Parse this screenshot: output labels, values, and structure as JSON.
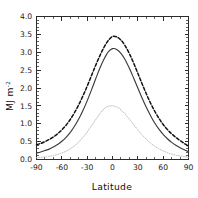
{
  "chart_data": {
    "type": "line",
    "title": "",
    "subtitle": "",
    "xlabel": "Latitude",
    "ylabel": "MJ m",
    "ylabel_exponent": "-2",
    "ylabel_full": "MJ m-2",
    "xlim": [
      -90,
      90
    ],
    "ylim": [
      0.0,
      4.0
    ],
    "xticks": [
      -90,
      -60,
      -30,
      0,
      30,
      60,
      90
    ],
    "xtick_labels": [
      "-90",
      "-60",
      "-30",
      "0",
      "30",
      "60",
      "90"
    ],
    "yticks": [
      0.0,
      0.5,
      1.0,
      1.5,
      2.0,
      2.5,
      3.0,
      3.5,
      4.0
    ],
    "ytick_labels": [
      "0.0",
      "0.5",
      "1.0",
      "1.5",
      "2.0",
      "2.5",
      "3.0",
      "3.5",
      "4.0"
    ],
    "x_minor_interval": 10,
    "y_minor_interval": 0.1,
    "grid": false,
    "legend": "none",
    "frame": "box-all-sides-inward-ticks",
    "x": [
      -90,
      -85,
      -80,
      -75,
      -70,
      -65,
      -60,
      -55,
      -50,
      -45,
      -40,
      -35,
      -30,
      -25,
      -20,
      -15,
      -10,
      -5,
      0,
      5,
      10,
      15,
      20,
      25,
      30,
      35,
      40,
      45,
      50,
      55,
      60,
      65,
      70,
      75,
      80,
      85,
      90
    ],
    "series": [
      {
        "name": "dashed-curve",
        "style": "dashed",
        "color": "#111111",
        "peak_value": 3.45,
        "peak_x": -2,
        "values": [
          0.41,
          0.45,
          0.5,
          0.56,
          0.63,
          0.72,
          0.83,
          0.96,
          1.12,
          1.31,
          1.53,
          1.78,
          2.05,
          2.34,
          2.63,
          2.9,
          3.14,
          3.33,
          3.44,
          3.43,
          3.34,
          3.18,
          2.96,
          2.7,
          2.41,
          2.12,
          1.84,
          1.58,
          1.35,
          1.15,
          0.98,
          0.84,
          0.72,
          0.62,
          0.53,
          0.45,
          0.37
        ]
      },
      {
        "name": "solid-curve",
        "style": "solid",
        "color": "#3b3b3b",
        "peak_value": 3.1,
        "peak_x": 0,
        "values": [
          0.18,
          0.21,
          0.25,
          0.29,
          0.35,
          0.42,
          0.51,
          0.62,
          0.76,
          0.93,
          1.13,
          1.37,
          1.64,
          1.94,
          2.25,
          2.55,
          2.81,
          3.01,
          3.1,
          3.08,
          2.97,
          2.79,
          2.55,
          2.28,
          2.0,
          1.72,
          1.46,
          1.23,
          1.02,
          0.85,
          0.7,
          0.58,
          0.48,
          0.4,
          0.33,
          0.27,
          0.22
        ]
      },
      {
        "name": "dotted-curve",
        "style": "dotted",
        "color": "#b9b9b9",
        "peak_value": 1.5,
        "peak_x": 0,
        "values": [
          0.05,
          0.06,
          0.07,
          0.09,
          0.11,
          0.14,
          0.18,
          0.23,
          0.3,
          0.38,
          0.49,
          0.62,
          0.77,
          0.94,
          1.11,
          1.28,
          1.42,
          1.49,
          1.5,
          1.47,
          1.39,
          1.27,
          1.13,
          0.98,
          0.83,
          0.69,
          0.57,
          0.46,
          0.37,
          0.3,
          0.24,
          0.19,
          0.15,
          0.12,
          0.1,
          0.08,
          0.06
        ]
      }
    ]
  }
}
